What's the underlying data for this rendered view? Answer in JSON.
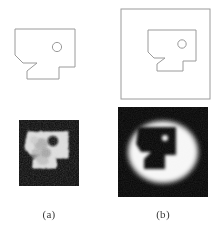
{
  "figure": {
    "title": "",
    "background_color": "#ffffff",
    "line_color": "#9a9a9a",
    "raster_background_color": "#050505",
    "raster_foreground_color": "#f2f2f2",
    "width_px": 217,
    "height_px": 230
  },
  "panels": [
    {
      "id": "a",
      "caption": "(a)",
      "has_bounding_frame": false,
      "rows": [
        {
          "kind": "line-drawing",
          "name": "outline-shape-a",
          "description": "notched rectangular polygon with circular hole",
          "stroke_color": "#9a9a9a",
          "stroke_width": 1
        },
        {
          "kind": "reconstruction",
          "name": "reconstruction-a",
          "description": "noisy grayscale reconstruction, bright object on dark background",
          "style": "speckled"
        }
      ]
    },
    {
      "id": "b",
      "caption": "(b)",
      "has_bounding_frame": true,
      "rows": [
        {
          "kind": "line-drawing",
          "name": "outline-shape-b",
          "description": "same polygon inside a square bounding frame",
          "stroke_color": "#9a9a9a",
          "stroke_width": 1
        },
        {
          "kind": "reconstruction",
          "name": "reconstruction-b",
          "description": "smooth reconstruction, bright halo ring with dark object interior",
          "style": "smooth-ring"
        }
      ]
    }
  ],
  "shape": {
    "name": "notched-polygon",
    "outline_points": "0,0 60,0 60,38 44,38 44,50 12,50 12,42 22,34 8,34 0,26",
    "hole": {
      "cx": 42,
      "cy": 18,
      "r": 4.6
    }
  },
  "captions": {
    "a": "(a)",
    "b": "(b)"
  }
}
